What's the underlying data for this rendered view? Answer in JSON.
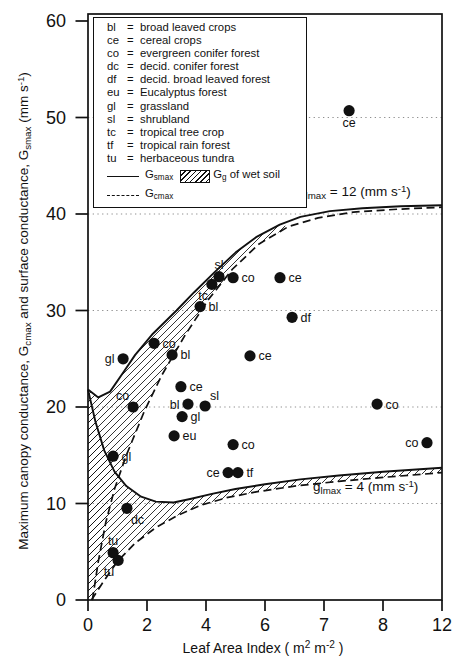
{
  "colors": {
    "ink": "#111111",
    "background": "#ffffff",
    "grid": "#8f8f8f"
  },
  "chart_data": {
    "type": "scatter",
    "title": "",
    "x_title": {
      "pre": "Leaf Area Index  ( m",
      "sup1": "2",
      "mid": " m",
      "sup2": "-2",
      "end": " )"
    },
    "y_title": {
      "p1": "Maximum canopy conductance, G",
      "sub1": "cmax",
      "p2": " and surface conductance, G",
      "sub2": "smax",
      "p3": "  (mm s",
      "sup": "-1",
      "p4": ")"
    },
    "x_axis": {
      "min": 0,
      "max": 12,
      "ticks": [
        {
          "v": 0,
          "label": "0"
        },
        {
          "v": 2,
          "label": "2"
        },
        {
          "v": 4,
          "label": "4"
        },
        {
          "v": 6,
          "label": "6"
        },
        {
          "v": 8,
          "label": "7"
        },
        {
          "v": 10,
          "label": "8"
        },
        {
          "v": 12,
          "label": "12"
        }
      ]
    },
    "y_axis": {
      "min": 0,
      "max": 60,
      "ticks": [
        {
          "v": 0,
          "label": "0"
        },
        {
          "v": 10,
          "label": "10"
        },
        {
          "v": 20,
          "label": "20"
        },
        {
          "v": 30,
          "label": "30"
        },
        {
          "v": 40,
          "label": "40"
        },
        {
          "v": 50,
          "label": "50"
        },
        {
          "v": 60,
          "label": "60"
        }
      ],
      "gridlines": [
        10,
        20,
        30,
        40,
        50
      ]
    },
    "points": [
      {
        "label": "ce",
        "x": 8.85,
        "y": 50.7,
        "pos": "below"
      },
      {
        "label": "sl",
        "x": 4.44,
        "y": 33.5,
        "pos": "above"
      },
      {
        "label": "tc",
        "x": 4.2,
        "y": 32.7,
        "pos": "below-left"
      },
      {
        "label": "co",
        "x": 4.92,
        "y": 33.4,
        "pos": "right"
      },
      {
        "label": "ce",
        "x": 6.51,
        "y": 33.4,
        "pos": "right"
      },
      {
        "label": "bl",
        "x": 3.8,
        "y": 30.4,
        "pos": "right"
      },
      {
        "label": "df",
        "x": 6.92,
        "y": 29.3,
        "pos": "right"
      },
      {
        "label": "co",
        "x": 2.24,
        "y": 26.6,
        "pos": "right"
      },
      {
        "label": "gl",
        "x": 1.19,
        "y": 25.0,
        "pos": "left"
      },
      {
        "label": "bl",
        "x": 2.85,
        "y": 25.4,
        "pos": "right"
      },
      {
        "label": "ce",
        "x": 5.49,
        "y": 25.3,
        "pos": "right"
      },
      {
        "label": "ce",
        "x": 3.15,
        "y": 22.1,
        "pos": "right"
      },
      {
        "label": "bl",
        "x": 3.39,
        "y": 20.3,
        "pos": "left"
      },
      {
        "label": "sl",
        "x": 3.97,
        "y": 20.1,
        "pos": "above-right"
      },
      {
        "label": "co",
        "x": 1.53,
        "y": 20.0,
        "pos": "above-left"
      },
      {
        "label": "gl",
        "x": 3.19,
        "y": 19.0,
        "pos": "right"
      },
      {
        "label": "eu",
        "x": 2.92,
        "y": 17.0,
        "pos": "right"
      },
      {
        "label": "co",
        "x": 4.92,
        "y": 16.1,
        "pos": "right"
      },
      {
        "label": "co",
        "x": 9.8,
        "y": 20.3,
        "pos": "right"
      },
      {
        "label": "co",
        "x": 11.49,
        "y": 16.3,
        "pos": "left"
      },
      {
        "label": "gl",
        "x": 0.85,
        "y": 14.9,
        "pos": "right"
      },
      {
        "label": "ce",
        "x": 4.75,
        "y": 13.2,
        "pos": "left"
      },
      {
        "label": "tf",
        "x": 5.08,
        "y": 13.2,
        "pos": "right"
      },
      {
        "label": "dc",
        "x": 1.32,
        "y": 9.5,
        "pos": "below-right"
      },
      {
        "label": "tu",
        "x": 0.85,
        "y": 4.9,
        "pos": "above"
      },
      {
        "label": "tu",
        "x": 1.02,
        "y": 4.1,
        "pos": "below-left"
      }
    ],
    "curves": [
      {
        "name": "Gsmax glmax=12",
        "style": "solid",
        "points": [
          [
            0,
            21.8
          ],
          [
            0.35,
            21.0
          ],
          [
            0.75,
            21.6
          ],
          [
            1.2,
            23.6
          ],
          [
            1.6,
            25.4
          ],
          [
            2.2,
            27.6
          ],
          [
            3.0,
            30.0
          ],
          [
            3.6,
            31.9
          ],
          [
            4.3,
            34.0
          ],
          [
            5.0,
            36.0
          ],
          [
            5.7,
            37.6
          ],
          [
            6.5,
            38.9
          ],
          [
            7.2,
            39.7
          ],
          [
            8.2,
            40.3
          ],
          [
            9.3,
            40.6
          ],
          [
            10.6,
            40.8
          ],
          [
            12,
            40.9
          ]
        ]
      },
      {
        "name": "Gcmax glmax=12",
        "style": "dashed",
        "points": [
          [
            0.15,
            0
          ],
          [
            0.35,
            4.0
          ],
          [
            0.6,
            8.0
          ],
          [
            0.9,
            11.5
          ],
          [
            1.3,
            15.0
          ],
          [
            1.9,
            19.5
          ],
          [
            2.5,
            23.3
          ],
          [
            3.3,
            27.5
          ],
          [
            4.1,
            31.2
          ],
          [
            4.9,
            34.3
          ],
          [
            5.8,
            36.9
          ],
          [
            6.8,
            38.7
          ],
          [
            7.8,
            39.6
          ],
          [
            9.0,
            40.2
          ],
          [
            10.5,
            40.5
          ],
          [
            12,
            40.7
          ]
        ]
      },
      {
        "name": "Gsmax glmax=4",
        "style": "solid",
        "points": [
          [
            0,
            21.8
          ],
          [
            0.25,
            18.5
          ],
          [
            0.55,
            15.5
          ],
          [
            0.9,
            13.3
          ],
          [
            1.3,
            11.8
          ],
          [
            1.8,
            10.7
          ],
          [
            2.3,
            10.2
          ],
          [
            2.9,
            10.1
          ],
          [
            3.5,
            10.5
          ],
          [
            4.2,
            11.0
          ],
          [
            5.0,
            11.5
          ],
          [
            6.0,
            12.0
          ],
          [
            7.2,
            12.5
          ],
          [
            8.5,
            12.9
          ],
          [
            10,
            13.3
          ],
          [
            12,
            13.7
          ]
        ]
      },
      {
        "name": "Gcmax glmax=4",
        "style": "dashed",
        "points": [
          [
            0.12,
            0
          ],
          [
            0.5,
            1.8
          ],
          [
            1.0,
            4.0
          ],
          [
            1.6,
            5.9
          ],
          [
            2.3,
            7.5
          ],
          [
            3.0,
            8.7
          ],
          [
            3.8,
            9.8
          ],
          [
            4.7,
            10.6
          ],
          [
            5.7,
            11.2
          ],
          [
            7.0,
            11.8
          ],
          [
            8.5,
            12.3
          ],
          [
            10,
            12.7
          ],
          [
            12,
            13.2
          ]
        ]
      }
    ],
    "hatch_between": [
      {
        "solid": 0,
        "dashed": 1,
        "xmax": 7.05
      },
      {
        "solid": 2,
        "dashed": 3,
        "xmax": 12.1
      }
    ],
    "annotations": [
      {
        "pre": "g",
        "sub": "lmax",
        "mid": " = 12 (mm s",
        "sup": "-1",
        "end": ")",
        "x": 7.12,
        "y": 43.2
      },
      {
        "pre": "g",
        "sub": "lmax",
        "mid": " = 4 (mm s",
        "sup": "-1",
        "end": ")",
        "x": 7.63,
        "y": 12.64
      }
    ],
    "legend": {
      "separator": "=",
      "items": [
        {
          "abbr": "bl",
          "desc": "broad leaved crops"
        },
        {
          "abbr": "ce",
          "desc": "cereal crops"
        },
        {
          "abbr": "co",
          "desc": "evergreen conifer forest"
        },
        {
          "abbr": "dc",
          "desc": "decid. conifer forest"
        },
        {
          "abbr": "df",
          "desc": "decid. broad leaved forest"
        },
        {
          "abbr": "eu",
          "desc": "Eucalyptus forest"
        },
        {
          "abbr": "gl",
          "desc": "grassland"
        },
        {
          "abbr": "sl",
          "desc": "shrubland"
        },
        {
          "abbr": "tc",
          "desc": "tropical tree crop"
        },
        {
          "abbr": "tf",
          "desc": "tropical rain forest"
        },
        {
          "abbr": "tu",
          "desc": "herbaceous tundra"
        }
      ],
      "gsmax": {
        "pre": "G",
        "sub": "smax"
      },
      "gg": {
        "pre": "G",
        "sub": "g",
        "post": " of wet soil"
      },
      "gcmax": {
        "pre": "G",
        "sub": "cmax"
      }
    }
  }
}
